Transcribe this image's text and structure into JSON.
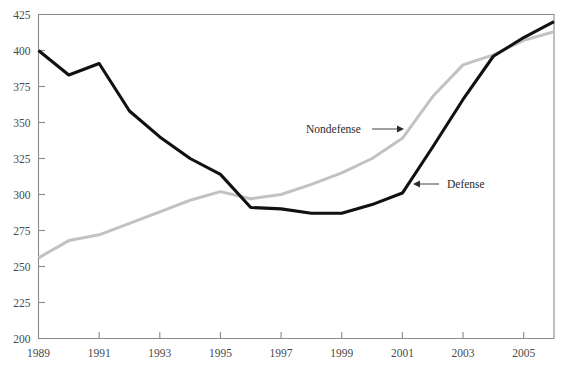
{
  "chart_data": {
    "type": "line",
    "title": "",
    "subtitle": "",
    "xlabel": "",
    "ylabel": "",
    "xlim": [
      1989,
      2006
    ],
    "ylim": [
      200,
      425
    ],
    "grid": false,
    "legend_position": "inline-annotations",
    "x": [
      1989,
      1990,
      1991,
      1992,
      1993,
      1994,
      1995,
      1996,
      1997,
      1998,
      1999,
      2000,
      2001,
      2002,
      2003,
      2004,
      2005,
      2006
    ],
    "x_tick_labels": [
      "1989",
      "1991",
      "1993",
      "1995",
      "1997",
      "1999",
      "2001",
      "2003",
      "2005"
    ],
    "x_tick_values": [
      1989,
      1991,
      1993,
      1995,
      1997,
      1999,
      2001,
      2003,
      2005
    ],
    "y_tick_labels": [
      "200",
      "225",
      "250",
      "275",
      "300",
      "325",
      "350",
      "375",
      "400",
      "425"
    ],
    "y_tick_values": [
      200,
      225,
      250,
      275,
      300,
      325,
      350,
      375,
      400,
      425
    ],
    "series": [
      {
        "name": "Defense",
        "color": "#111111",
        "values": [
          400,
          383,
          391,
          358,
          340,
          325,
          314,
          291,
          290,
          287,
          287,
          293,
          301,
          333,
          366,
          396,
          409,
          420
        ]
      },
      {
        "name": "Nondefense",
        "color": "#c2c2c2",
        "values": [
          256,
          268,
          272,
          280,
          288,
          296,
          302,
          297,
          300,
          307,
          315,
          325,
          339,
          368,
          390,
          397,
          407,
          413
        ]
      }
    ],
    "annotations": [
      {
        "label": "Nondefense",
        "target_series": "Nondefense",
        "arrow_direction": "right",
        "text_x": 306,
        "text_y": 133,
        "line_x1": 372,
        "line_x2": 404,
        "line_y": 129
      },
      {
        "label": "Defense",
        "target_series": "Defense",
        "arrow_direction": "left",
        "text_x": 447,
        "text_y": 188,
        "line_x1": 439,
        "line_x2": 413,
        "line_y": 184
      }
    ]
  }
}
